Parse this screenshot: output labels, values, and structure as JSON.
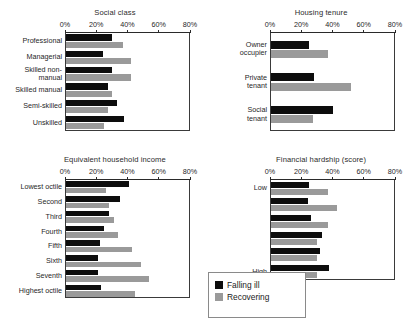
{
  "legend": {
    "items": [
      {
        "label": "Falling ill",
        "color": "#0d0d0d",
        "key": "falling_ill"
      },
      {
        "label": "Recovering",
        "color": "#9a9a9a",
        "key": "recovering"
      }
    ]
  },
  "axis": {
    "ticks": [
      "0%",
      "20%",
      "40%",
      "60%",
      "80%"
    ],
    "min": 0,
    "max": 80
  },
  "chart_data": [
    {
      "id": "social-class",
      "type": "bar",
      "orientation": "horizontal",
      "title": "Social class",
      "xlabel": "",
      "ylabel": "",
      "xlim": [
        0,
        80
      ],
      "xticks": [
        0,
        20,
        40,
        60,
        80
      ],
      "xticklabels": [
        "0%",
        "20%",
        "40%",
        "60%",
        "80%"
      ],
      "grid": false,
      "legend_position": "external-bottom-center",
      "categories": [
        "Professional",
        "Managerial",
        "Skilled non-\nmanual",
        "Skilled manual",
        "Semi-skilled",
        "Unskilled"
      ],
      "series": [
        {
          "name": "Falling ill",
          "values": [
            30,
            24,
            30,
            27,
            33,
            38
          ]
        },
        {
          "name": "Recovering",
          "values": [
            37,
            42,
            42,
            30,
            27,
            25
          ]
        }
      ]
    },
    {
      "id": "housing-tenure",
      "type": "bar",
      "orientation": "horizontal",
      "title": "Housing tenure",
      "xlabel": "",
      "ylabel": "",
      "xlim": [
        0,
        80
      ],
      "xticks": [
        0,
        20,
        40,
        60,
        80
      ],
      "xticklabels": [
        "0%",
        "20%",
        "40%",
        "60%",
        "80%"
      ],
      "grid": false,
      "legend_position": "external-bottom-center",
      "categories": [
        "Owner\noccupier",
        "Private\ntenant",
        "Social\ntenant"
      ],
      "series": [
        {
          "name": "Falling ill",
          "values": [
            25,
            28,
            40
          ]
        },
        {
          "name": "Recovering",
          "values": [
            37,
            52,
            27
          ]
        }
      ]
    },
    {
      "id": "equivalent-household-income",
      "type": "bar",
      "orientation": "horizontal",
      "title": "Equivalent household income",
      "xlabel": "",
      "ylabel": "",
      "xlim": [
        0,
        80
      ],
      "xticks": [
        0,
        20,
        40,
        60,
        80
      ],
      "xticklabels": [
        "0%",
        "20%",
        "40%",
        "60%",
        "80%"
      ],
      "grid": false,
      "legend_position": "external-bottom-center",
      "categories": [
        "Lowest octile",
        "Second",
        "Third",
        "Fourth",
        "Fifth",
        "Sixth",
        "Seventh",
        "Highest octile"
      ],
      "series": [
        {
          "name": "Falling ill",
          "values": [
            41,
            35,
            28,
            25,
            22,
            21,
            21,
            23
          ]
        },
        {
          "name": "Recovering",
          "values": [
            26,
            28,
            31,
            34,
            43,
            49,
            54,
            45
          ]
        }
      ]
    },
    {
      "id": "financial-hardship",
      "type": "bar",
      "orientation": "horizontal",
      "title": "Financial hardship (score)",
      "xlabel": "",
      "ylabel": "",
      "xlim": [
        0,
        80
      ],
      "xticks": [
        0,
        20,
        40,
        60,
        80
      ],
      "xticklabels": [
        "0%",
        "20%",
        "40%",
        "60%",
        "80%"
      ],
      "grid": false,
      "legend_position": "external-bottom-center",
      "categories": [
        "Low",
        "",
        "",
        "",
        "",
        "High"
      ],
      "series": [
        {
          "name": "Falling ill",
          "values": [
            25,
            24,
            26,
            33,
            32,
            38
          ]
        },
        {
          "name": "Recovering",
          "values": [
            37,
            43,
            37,
            30,
            30,
            30
          ]
        }
      ]
    }
  ]
}
